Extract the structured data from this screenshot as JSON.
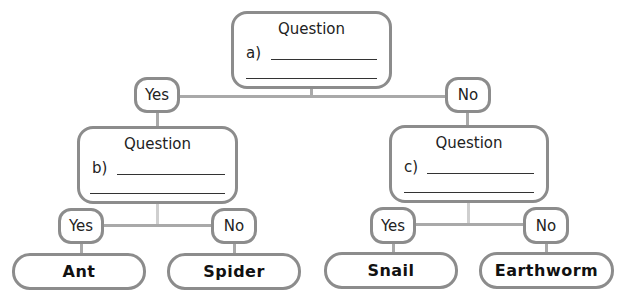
{
  "diagram": {
    "type": "dichotomous-key",
    "root": {
      "title": "Question",
      "label": "a)",
      "yes": "Yes",
      "no": "No"
    },
    "left": {
      "title": "Question",
      "label": "b)",
      "yes": "Yes",
      "no": "No",
      "yes_leaf": "Ant",
      "no_leaf": "Spider"
    },
    "right": {
      "title": "Question",
      "label": "c)",
      "yes": "Yes",
      "no": "No",
      "yes_leaf": "Snail",
      "no_leaf": "Earthworm"
    }
  },
  "colors": {
    "border": "#8c8c8c",
    "connector": "#a9a9a9",
    "connector_light": "#cfcfcf",
    "text": "#222222"
  }
}
